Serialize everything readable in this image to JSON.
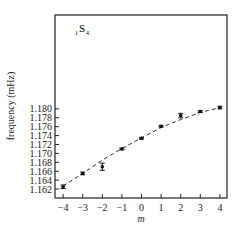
{
  "chart_data": {
    "type": "scatter",
    "title": "",
    "annotation": {
      "prefix": "1",
      "main": "S",
      "subscript": "4"
    },
    "xlabel": "m",
    "ylabel": "frequency (mHz)",
    "xlim": [
      -4.4,
      4.4
    ],
    "ylim": [
      1.1612,
      1.1812
    ],
    "xticks": [
      -4,
      -3,
      -2,
      -1,
      0,
      1,
      2,
      3,
      4
    ],
    "xtick_labels": [
      "−4",
      "−3",
      "−2",
      "−1",
      "0",
      "1",
      "2",
      "3",
      "4"
    ],
    "yticks": [
      1.162,
      1.164,
      1.166,
      1.168,
      1.17,
      1.172,
      1.174,
      1.176,
      1.178,
      1.18
    ],
    "ytick_labels": [
      "1.162",
      "1.164",
      "1.166",
      "1.168",
      "1.170",
      "1.172",
      "1.174",
      "1.176",
      "1.178",
      "1.180"
    ],
    "grid": false,
    "series": [
      {
        "name": "measured",
        "style": "points-with-errorbars",
        "x": [
          -4,
          -3,
          -2,
          -1,
          0,
          1,
          2,
          3,
          4
        ],
        "y": [
          1.1625,
          1.1655,
          1.167,
          1.171,
          1.1734,
          1.1761,
          1.1785,
          1.1794,
          1.1803
        ],
        "yerr": [
          0.0004,
          0.0003,
          0.0008,
          0.0002,
          0.0002,
          0.0002,
          0.0005,
          0.0002,
          0.0003
        ]
      },
      {
        "name": "fit",
        "style": "dashed-line",
        "x": [
          -4,
          -3,
          -2,
          -1,
          0,
          1,
          2,
          3,
          4
        ],
        "y": [
          1.1627,
          1.1655,
          1.1685,
          1.1711,
          1.1735,
          1.1758,
          1.1776,
          1.1792,
          1.1803
        ]
      }
    ]
  }
}
